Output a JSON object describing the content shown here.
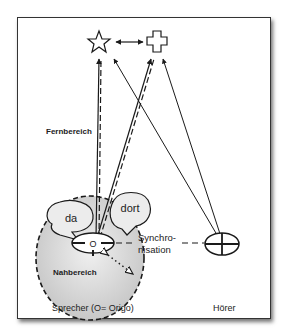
{
  "diagram": {
    "labels": {
      "far_zone": "Fernbereich",
      "near_zone": "Nahbereich",
      "speaker": "Sprecher (O= Origo)",
      "listener": "Hörer",
      "sync_line1": "Synchro-",
      "sync_line2": "nisation",
      "bubble_da": "da",
      "bubble_dort": "dort",
      "origo": "O"
    },
    "symbols": {
      "star": "star-icon",
      "cross": "cross-icon"
    },
    "colors": {
      "line": "#1a1a1a",
      "near_zone_fill": "#cfcfcf",
      "frame_border": "#333333"
    }
  }
}
